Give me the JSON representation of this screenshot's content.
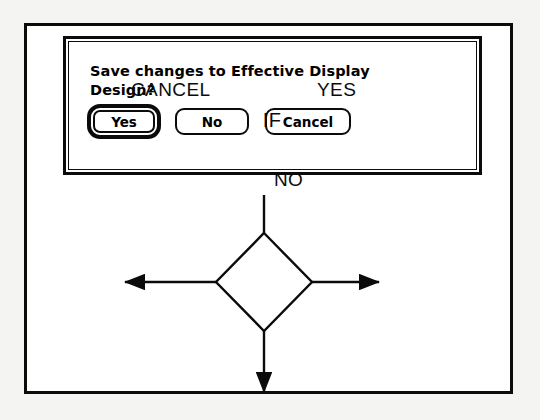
{
  "dialog": {
    "message": "Save changes to Effective Display\nDesign?",
    "buttons": [
      {
        "name": "yes-button",
        "label": "Yes",
        "default": true
      },
      {
        "name": "no-button",
        "label": "No",
        "default": false
      },
      {
        "name": "cancel-button",
        "label": "Cancel",
        "default": false
      }
    ]
  },
  "flowchart": {
    "decision_label": "IF",
    "branch_left": "CANCEL",
    "branch_right": "YES",
    "branch_down": "NO"
  },
  "colors": {
    "ink": "#0b0b0b",
    "paper": "#ffffff",
    "page_background": "#f4f4f2"
  }
}
